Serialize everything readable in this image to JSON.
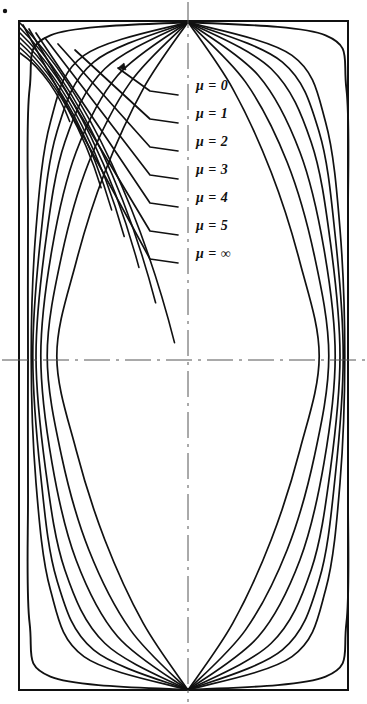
{
  "figure": {
    "name": "mu-parameter-curve-family-plot",
    "background_color": "#ffffff",
    "ink_color": "#111111",
    "corner_dot": {
      "name": "registration-dot",
      "x": 5,
      "y": 11,
      "r": 2.2
    },
    "frame": {
      "name": "plot-frame",
      "x": 19,
      "y": 21,
      "width": 329,
      "height": 669,
      "stroke_width": 2.0
    },
    "centerlines": {
      "type": "dash-dot",
      "color": "#555555",
      "stroke_width": 1.0,
      "vertical_x": 188,
      "vertical_y0": 2,
      "vertical_y1": 702,
      "horizontal_y": 360,
      "horizontal_x0": 2,
      "horizontal_x1": 365,
      "dash_pattern": "26,6,3,6"
    },
    "convergence_points": {
      "top": {
        "x": 188,
        "y": 22
      },
      "bottom": {
        "x": 188,
        "y": 690
      }
    },
    "labels": [
      {
        "text": "μ = 0",
        "x": 196,
        "y": 88,
        "leader_end_y": 95,
        "leader_knee_x": 150,
        "leader_origin_x": 118,
        "leader_origin_y": 68,
        "arrow": true
      },
      {
        "text": "μ = 1",
        "x": 196,
        "y": 116,
        "leader_end_y": 123,
        "leader_knee_x": 150,
        "leader_origin_x": 75,
        "leader_origin_y": 50,
        "arrow": false
      },
      {
        "text": "μ = 2",
        "x": 196,
        "y": 144,
        "leader_end_y": 151,
        "leader_knee_x": 150,
        "leader_origin_x": 58,
        "leader_origin_y": 44,
        "arrow": false
      },
      {
        "text": "μ = 3",
        "x": 196,
        "y": 172,
        "leader_end_y": 179,
        "leader_knee_x": 150,
        "leader_origin_x": 45,
        "leader_origin_y": 38,
        "arrow": false
      },
      {
        "text": "μ = 4",
        "x": 196,
        "y": 200,
        "leader_end_y": 207,
        "leader_knee_x": 150,
        "leader_origin_x": 36,
        "leader_origin_y": 33,
        "arrow": false
      },
      {
        "text": "μ = 5",
        "x": 196,
        "y": 228,
        "leader_end_y": 235,
        "leader_knee_x": 150,
        "leader_origin_x": 29,
        "leader_origin_y": 29,
        "arrow": false
      },
      {
        "text": "μ = ∞",
        "x": 196,
        "y": 256,
        "leader_end_y": 263,
        "leader_knee_x": 150,
        "leader_origin_x": 23,
        "leader_origin_y": 25,
        "arrow": false
      }
    ]
  },
  "chart_data": {
    "type": "line",
    "title": "",
    "subtitle": "",
    "xlabel": "",
    "ylabel": "",
    "grid": false,
    "legend_position": "inline-leader-labels",
    "parameter_symbol": "μ",
    "parameter_values": [
      "0",
      "1",
      "2",
      "3",
      "4",
      "5",
      "∞"
    ],
    "legend_entries": [
      "μ = 0",
      "μ = 1",
      "μ = 2",
      "μ = 3",
      "μ = 4",
      "μ = 5",
      "μ = ∞"
    ],
    "xlim": [
      -1,
      1
    ],
    "ylim": [
      -1,
      1
    ],
    "axis_frame": "rectangular-box",
    "symmetry": "four-fold: mirrored left/right about vertical centerline and top/bottom about horizontal centerline",
    "series": [
      {
        "name": "μ = 0",
        "bulge": 1.0,
        "wall_hug": 0.0,
        "points_normalized": [
          [
            0,
            1
          ],
          [
            0.28,
            0.8
          ],
          [
            0.52,
            0.55
          ],
          [
            0.7,
            0.28
          ],
          [
            0.82,
            0.0
          ],
          [
            0.7,
            -0.28
          ],
          [
            0.52,
            -0.55
          ],
          [
            0.28,
            -0.8
          ],
          [
            0,
            -1
          ]
        ]
      },
      {
        "name": "μ = 1",
        "bulge": 0.82,
        "wall_hug": 0.18,
        "points_normalized": [
          [
            0,
            1
          ],
          [
            0.36,
            0.82
          ],
          [
            0.62,
            0.58
          ],
          [
            0.79,
            0.3
          ],
          [
            0.88,
            0.0
          ],
          [
            0.79,
            -0.3
          ],
          [
            0.62,
            -0.58
          ],
          [
            0.36,
            -0.82
          ],
          [
            0,
            -1
          ]
        ]
      },
      {
        "name": "μ = 2",
        "bulge": 0.68,
        "wall_hug": 0.34,
        "points_normalized": [
          [
            0,
            1
          ],
          [
            0.44,
            0.84
          ],
          [
            0.7,
            0.61
          ],
          [
            0.85,
            0.32
          ],
          [
            0.92,
            0.0
          ],
          [
            0.85,
            -0.32
          ],
          [
            0.7,
            -0.61
          ],
          [
            0.44,
            -0.84
          ],
          [
            0,
            -1
          ]
        ]
      },
      {
        "name": "μ = 3",
        "bulge": 0.56,
        "wall_hug": 0.48,
        "points_normalized": [
          [
            0,
            1
          ],
          [
            0.52,
            0.86
          ],
          [
            0.77,
            0.64
          ],
          [
            0.89,
            0.34
          ],
          [
            0.95,
            0.0
          ],
          [
            0.89,
            -0.34
          ],
          [
            0.77,
            -0.64
          ],
          [
            0.52,
            -0.86
          ],
          [
            0,
            -1
          ]
        ]
      },
      {
        "name": "μ = 4",
        "bulge": 0.46,
        "wall_hug": 0.6,
        "points_normalized": [
          [
            0,
            1
          ],
          [
            0.59,
            0.88
          ],
          [
            0.82,
            0.67
          ],
          [
            0.92,
            0.36
          ],
          [
            0.97,
            0.0
          ],
          [
            0.92,
            -0.36
          ],
          [
            0.82,
            -0.67
          ],
          [
            0.59,
            -0.88
          ],
          [
            0,
            -1
          ]
        ]
      },
      {
        "name": "μ = 5",
        "bulge": 0.38,
        "wall_hug": 0.7,
        "points_normalized": [
          [
            0,
            1
          ],
          [
            0.65,
            0.9
          ],
          [
            0.86,
            0.7
          ],
          [
            0.95,
            0.38
          ],
          [
            0.98,
            0.0
          ],
          [
            0.95,
            -0.38
          ],
          [
            0.86,
            -0.7
          ],
          [
            0.65,
            -0.9
          ],
          [
            0,
            -1
          ]
        ]
      },
      {
        "name": "μ = ∞",
        "bulge": 0.0,
        "wall_hug": 1.0,
        "points_normalized": [
          [
            0,
            1
          ],
          [
            0.86,
            0.96
          ],
          [
            0.99,
            0.8
          ],
          [
            1.0,
            0.4
          ],
          [
            1.0,
            0.0
          ],
          [
            1.0,
            -0.4
          ],
          [
            0.99,
            -0.8
          ],
          [
            0.86,
            -0.96
          ],
          [
            0,
            -1
          ]
        ]
      }
    ]
  }
}
